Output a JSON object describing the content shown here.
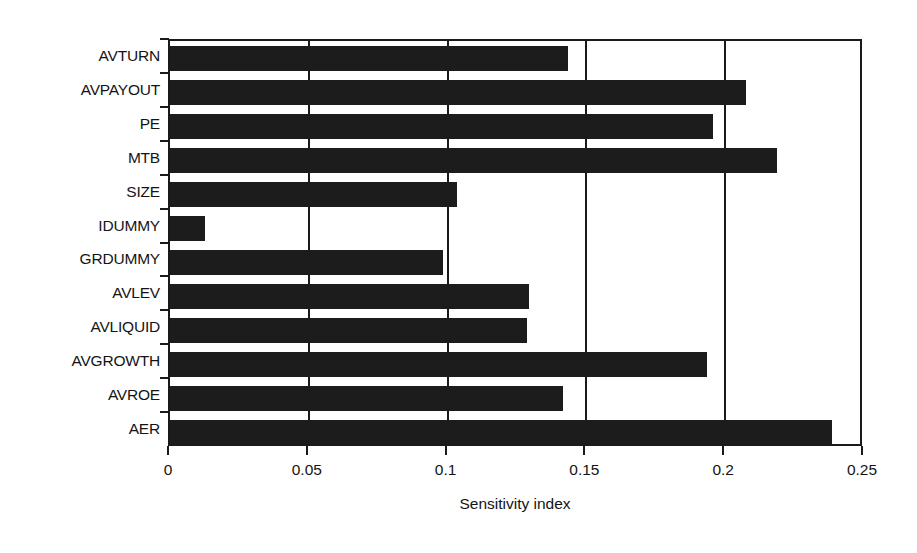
{
  "chart_data": {
    "type": "bar",
    "orientation": "horizontal",
    "title": "",
    "xlabel": "Sensitivity index",
    "ylabel": "",
    "xlim": [
      0,
      0.25
    ],
    "xticks": [
      "0",
      "0.05",
      "0.1",
      "0.15",
      "0.2",
      "0.25"
    ],
    "xtick_values": [
      0,
      0.05,
      0.1,
      0.15,
      0.2,
      0.25
    ],
    "grid": "vertical",
    "legend": "none",
    "bar_color": "#1c1c1c",
    "categories": [
      "AVTURN",
      "AVPAYOUT",
      "PE",
      "MTB",
      "SIZE",
      "IDUMMY",
      "GRDUMMY",
      "AVLEV",
      "AVLIQUID",
      "AVGROWTH",
      "AVROE",
      "AER"
    ],
    "values": [
      0.1435,
      0.2075,
      0.1955,
      0.2185,
      0.1035,
      0.0125,
      0.0985,
      0.1295,
      0.1285,
      0.1935,
      0.1415,
      0.2385
    ]
  }
}
